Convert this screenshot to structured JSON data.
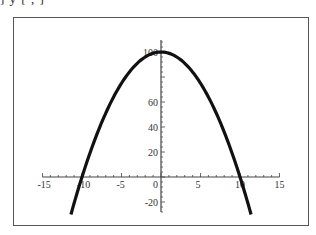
{
  "header": {
    "cut_off_text": "] y [   ,   ]"
  },
  "chart_data": {
    "type": "line",
    "title": "",
    "xlabel": "",
    "ylabel": "",
    "function": "y = 100 - x^2",
    "xlim": [
      -15,
      15
    ],
    "ylim": [
      -30,
      110
    ],
    "x_domain": [
      -11.4,
      11.4
    ],
    "x_ticks": [
      -15,
      -10,
      -5,
      0,
      5,
      10,
      15
    ],
    "x_tick_labels": [
      "-15",
      "-10",
      "-5",
      "0",
      "5",
      "10",
      "15"
    ],
    "y_ticks": [
      -20,
      20,
      40,
      60,
      100
    ],
    "y_tick_labels": [
      "-20",
      "20",
      "40",
      "60",
      "100"
    ],
    "series": [
      {
        "name": "curve",
        "color": "#111111",
        "x": [
          -11.4,
          -10,
          -8,
          -6,
          -4,
          -2,
          0,
          2,
          4,
          6,
          8,
          10,
          11.4
        ],
        "y": [
          -30,
          0,
          36,
          64,
          84,
          96,
          100,
          96,
          84,
          64,
          36,
          0,
          -30
        ]
      }
    ],
    "grid": false,
    "legend": null,
    "axes_style": "crossing at origin",
    "frame": true
  }
}
